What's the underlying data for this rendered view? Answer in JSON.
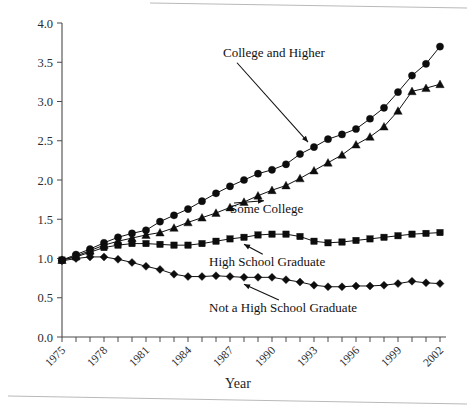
{
  "figure": {
    "background_color": "#ffffff",
    "ink_color": "#111111",
    "axis_color": "#4a4a4a",
    "page_edge_color": "#b9b9b9"
  },
  "chart_data": {
    "type": "line",
    "title": "",
    "subtitle": "",
    "xlabel": "Year",
    "ylabel": "",
    "xlim": [
      1975,
      2002
    ],
    "ylim": [
      0.0,
      4.0
    ],
    "grid": false,
    "legend_position": "inline-annotations",
    "y_ticks": [
      "0.0",
      "0.5",
      "1.0",
      "1.5",
      "2.0",
      "2.5",
      "3.0",
      "3.5",
      "4.0"
    ],
    "y_tick_values": [
      0.0,
      0.5,
      1.0,
      1.5,
      2.0,
      2.5,
      3.0,
      3.5,
      4.0
    ],
    "x_ticks": [
      "1975",
      "1978",
      "1981",
      "1984",
      "1987",
      "1990",
      "1993",
      "1996",
      "1999",
      "2002"
    ],
    "x_tick_values": [
      1975,
      1978,
      1981,
      1984,
      1987,
      1990,
      1993,
      1996,
      1999,
      2002
    ],
    "x_minor_tick_values": [
      1975,
      1976,
      1977,
      1978,
      1979,
      1980,
      1981,
      1982,
      1983,
      1984,
      1985,
      1986,
      1987,
      1988,
      1989,
      1990,
      1991,
      1992,
      1993,
      1994,
      1995,
      1996,
      1997,
      1998,
      1999,
      2000,
      2001,
      2002
    ],
    "x": [
      1975,
      1976,
      1977,
      1978,
      1979,
      1980,
      1981,
      1982,
      1983,
      1984,
      1985,
      1986,
      1987,
      1988,
      1989,
      1990,
      1991,
      1992,
      1993,
      1994,
      1995,
      1996,
      1997,
      1998,
      1999,
      2000,
      2001,
      2002
    ],
    "series": [
      {
        "name": "College and Higher",
        "marker": "circle",
        "color": "#0d0d0d",
        "values": [
          0.98,
          1.05,
          1.12,
          1.2,
          1.27,
          1.32,
          1.36,
          1.47,
          1.55,
          1.63,
          1.73,
          1.83,
          1.92,
          2.0,
          2.08,
          2.13,
          2.2,
          2.33,
          2.42,
          2.52,
          2.58,
          2.65,
          2.78,
          2.92,
          3.12,
          3.33,
          3.48,
          3.7
        ]
      },
      {
        "name": "Some College",
        "marker": "triangle",
        "color": "#0d0d0d",
        "values": [
          0.98,
          1.03,
          1.1,
          1.17,
          1.22,
          1.26,
          1.3,
          1.33,
          1.39,
          1.46,
          1.52,
          1.58,
          1.65,
          1.72,
          1.8,
          1.87,
          1.93,
          2.02,
          2.12,
          2.22,
          2.32,
          2.45,
          2.55,
          2.68,
          2.88,
          3.13,
          3.17,
          3.22
        ]
      },
      {
        "name": "High School Graduate",
        "marker": "square",
        "color": "#0d0d0d",
        "values": [
          0.98,
          1.02,
          1.08,
          1.14,
          1.17,
          1.19,
          1.19,
          1.18,
          1.17,
          1.17,
          1.19,
          1.22,
          1.25,
          1.27,
          1.3,
          1.31,
          1.31,
          1.28,
          1.22,
          1.2,
          1.21,
          1.23,
          1.25,
          1.27,
          1.29,
          1.31,
          1.32,
          1.33
        ]
      },
      {
        "name": "Not a High School Graduate",
        "marker": "diamond",
        "color": "#0d0d0d",
        "values": [
          0.97,
          1.0,
          1.02,
          1.02,
          0.99,
          0.95,
          0.9,
          0.86,
          0.8,
          0.77,
          0.77,
          0.78,
          0.77,
          0.76,
          0.76,
          0.76,
          0.73,
          0.7,
          0.66,
          0.64,
          0.64,
          0.65,
          0.65,
          0.66,
          0.68,
          0.71,
          0.69,
          0.68
        ]
      }
    ],
    "annotations": [
      {
        "text": "College and Higher",
        "target_series": "College and Higher",
        "target_x": 1993,
        "text_x": 1986.5,
        "text_y": 3.57
      },
      {
        "text": "Some College",
        "target_series": "Some College",
        "target_x": 1989,
        "text_x": 1987.0,
        "text_y": 1.58
      },
      {
        "text": "High School Graduate",
        "target_series": "High School Graduate",
        "target_x": 1988,
        "text_x": 1985.5,
        "text_y": 0.9
      },
      {
        "text": "Not a High School Graduate",
        "target_series": "Not a High School Graduate",
        "target_x": 1988,
        "text_x": 1985.5,
        "text_y": 0.32
      }
    ]
  }
}
